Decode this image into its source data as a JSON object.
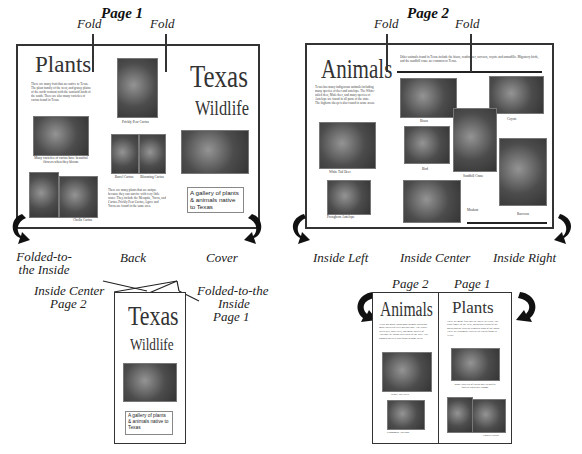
{
  "page1": {
    "heading": "Page 1",
    "fold_labels": [
      "Fold",
      "Fold"
    ],
    "panels": {
      "left": {
        "title": "Plants",
        "body": "There are many fruit that are native to Texas. The plant family of the west, and grassy plains of the north contrast with the semiarid lands of the south. There are also many varieties of cactus found in Texas.",
        "captions": [
          "Many varieties of cactus have beautiful flowers when they bloom.",
          "Cholla Cactus"
        ]
      },
      "center": {
        "captions": [
          "Prickly Pear Cactus",
          "Barrel Cactus",
          "Blooming Cactus"
        ],
        "body": "There are many plants that are unique because they can survive with very little water. They include the Mesquite, Yucca, and Cactus. Prickly Pear Cactus, Agave and Yucca are found in the same area."
      },
      "right": {
        "title_line1": "Texas",
        "title_line2": "Wildlife",
        "tagline": "A gallery of plants & animals native to Texas"
      }
    },
    "bottom_labels": {
      "left": "Folded-to-the Inside",
      "center": "Back",
      "right": "Cover"
    }
  },
  "page2": {
    "heading": "Page 2",
    "fold_labels": [
      "Fold",
      "Fold"
    ],
    "panels": {
      "left": {
        "title": "Animals",
        "body": "Texas has many indigenous animals including many species of deer and antelope. The White-tailed deer, Mule deer, and many species of Antelope are found in all parts of the state. The bighorn sheep is also found in some areas.",
        "captions": [
          "White Tail Deer",
          "Pronghorn Antelope"
        ]
      },
      "center_right": {
        "intro": "Other animals found in Texas include the bison, roadrunner, raccoon, coyote and armadillo. Migratory birds, and the sandhill crane are common to Texas.",
        "captions": [
          "Bison",
          "Coyote",
          "Bird",
          "Sandhill Crane",
          "Muskrat",
          "Raccoon"
        ]
      }
    },
    "bottom_labels": {
      "left": "Inside Left",
      "center": "Inside Center",
      "right": "Inside Right"
    }
  },
  "folded_view": {
    "label_left_line1": "Inside Center",
    "label_left_line2": "Page 2",
    "label_right_line1": "Folded-to-the",
    "label_right_line2": "Inside",
    "label_right_line3": "Page 1",
    "title_line1": "Texas",
    "title_line2": "Wildlife",
    "tagline": "A gallery of plants & animals native to Texas"
  },
  "open_view": {
    "label_page2": "Page 2",
    "label_page1": "Page 1",
    "left_title": "Animals",
    "right_title": "Plants",
    "left_captions": [
      "White Tail Deer",
      "Pronghorn Antelope"
    ],
    "right_captions": [
      "Many varieties of cactus have beautiful flowers when they bloom.",
      "Cholla Cactus"
    ]
  },
  "colors": {
    "ink": "#222222",
    "border": "#333333",
    "photo": "#555555"
  }
}
